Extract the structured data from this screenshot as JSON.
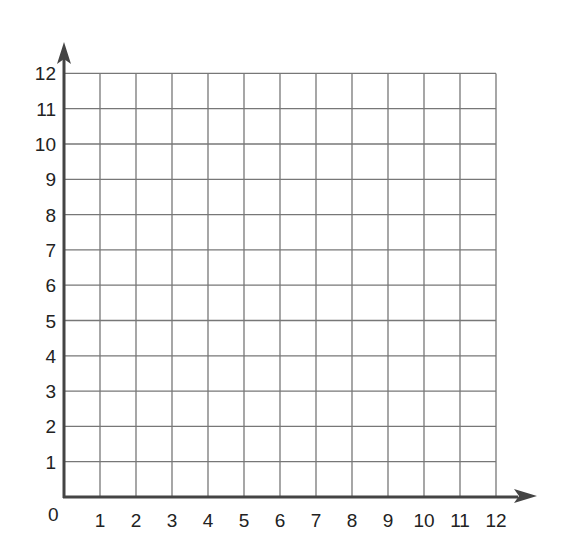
{
  "chart_data": {
    "type": "scatter",
    "title": "",
    "xlabel": "",
    "ylabel": "",
    "xlim": [
      0,
      12
    ],
    "ylim": [
      0,
      12
    ],
    "grid": true,
    "x_ticks": [
      "1",
      "2",
      "3",
      "4",
      "5",
      "6",
      "7",
      "8",
      "9",
      "10",
      "11",
      "12"
    ],
    "y_ticks": [
      "1",
      "2",
      "3",
      "4",
      "5",
      "6",
      "7",
      "8",
      "9",
      "10",
      "11",
      "12"
    ],
    "origin_label": "0",
    "series": [],
    "colors": {
      "axis": "#444444",
      "grid": "#777777",
      "text": "#222222",
      "background": "#ffffff"
    }
  }
}
